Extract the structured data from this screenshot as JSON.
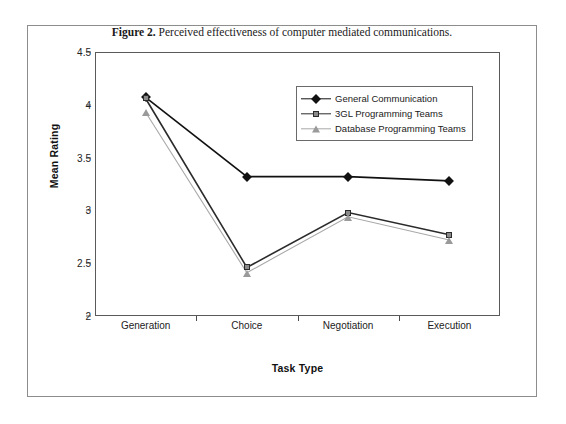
{
  "caption": {
    "label": "Figure 2.",
    "text": "Perceived effectiveness of computer mediated communications."
  },
  "chart_data": {
    "type": "line",
    "title": "Perceived effectiveness of computer mediated communications.",
    "xlabel": "Task Type",
    "ylabel": "Mean Rating",
    "categories": [
      "Generation",
      "Choice",
      "Negotiation",
      "Execution"
    ],
    "ylim": [
      2,
      4.5
    ],
    "yticks": [
      "2",
      "2.5",
      "3",
      "3.5",
      "4",
      "4.5"
    ],
    "ytick_values": [
      2,
      2.5,
      3,
      3.5,
      4,
      4.5
    ],
    "grid": false,
    "legend_position": "inside-top-right",
    "series": [
      {
        "name": "General Communication",
        "marker": "diamond",
        "color": "#111111",
        "values": [
          4.07,
          3.32,
          3.32,
          3.28
        ]
      },
      {
        "name": "3GL Programming Teams",
        "marker": "square",
        "color": "#8a8a8a",
        "values": [
          4.06,
          2.46,
          2.98,
          2.77
        ]
      },
      {
        "name": "Database Programming Teams",
        "marker": "triangle",
        "color": "#9a9a9a",
        "values": [
          3.93,
          2.41,
          2.94,
          2.72
        ]
      }
    ]
  }
}
